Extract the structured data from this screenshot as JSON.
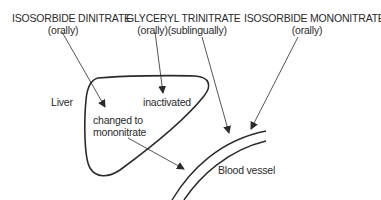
{
  "drugs": [
    {
      "name": "ISOSORBIDE DINITRATE",
      "route": "(orally)"
    },
    {
      "name": "GLYCERYL TRINITRATE",
      "route": "(orally)(sublingually)"
    },
    {
      "name": "ISOSORBIDE MONONITRATE",
      "route": "(orally)"
    }
  ],
  "organs": {
    "liver": "Liver",
    "blood_vessel": "Blood vessel"
  },
  "liver_outcomes": {
    "inactivated": "inactivated",
    "changed_line1": "changed to",
    "changed_line2": "mononitrate"
  },
  "colors": {
    "ink": "#2a2a2a",
    "background": "#ffffff"
  }
}
